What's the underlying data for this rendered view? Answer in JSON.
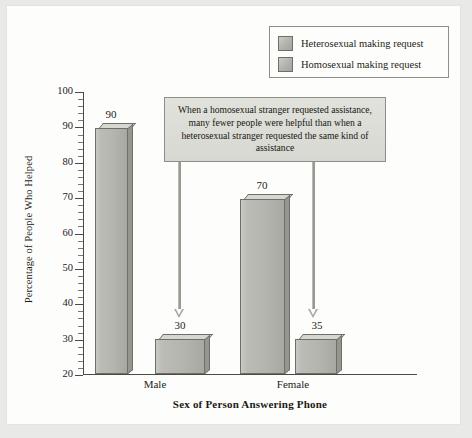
{
  "chart_data": {
    "type": "bar",
    "title": "",
    "xlabel": "Sex of Person Answering Phone",
    "ylabel": "Percentage of People Who Helped",
    "categories": [
      "Male",
      "Female"
    ],
    "series": [
      {
        "name": "Heterosexual making request",
        "values": [
          90,
          70
        ]
      },
      {
        "name": "Homosexual making request",
        "values": [
          30,
          35
        ]
      }
    ],
    "ylim": [
      20,
      100
    ],
    "ytick_labels": [
      "100",
      "90",
      "80",
      "70",
      "60",
      "50",
      "40",
      "30",
      "20"
    ],
    "ytick_values": [
      100,
      90,
      80,
      70,
      60,
      50,
      40,
      30,
      20
    ],
    "minor_tick_step": 2,
    "grid": false,
    "legend_position": "top-right",
    "annotation": "When a homosexual stranger requested assistance, many fewer people were helpful than when a heterosexual stranger requested the same kind of assistance",
    "bar_value_labels": [
      "90",
      "30",
      "70",
      "35"
    ],
    "colors": {
      "bar_face": "#b4b4ae",
      "bar_top": "#d7d7d2",
      "bar_side": "#96968f",
      "bar_outline": "#6f6f69",
      "axis": "#4a4a46",
      "background": "#fdfdfb",
      "page_background": "#e9e9e7",
      "annotation_fill": "#dcdcd7",
      "arrow": "#9a9a93"
    }
  },
  "legend": {
    "items": [
      {
        "label": "Heterosexual making request"
      },
      {
        "label": "Homosexual making request"
      }
    ]
  },
  "axes": {
    "y_title": "Percentage of People Who Helped",
    "x_title": "Sex of Person Answering Phone",
    "y_ticks": [
      "100",
      "90",
      "80",
      "70",
      "60",
      "50",
      "40",
      "30",
      "20"
    ],
    "x_categories": [
      "Male",
      "Female"
    ]
  },
  "bars": [
    {
      "value_label": "90",
      "group": "Male",
      "series": "Heterosexual making request"
    },
    {
      "value_label": "30",
      "group": "Male",
      "series": "Homosexual making request"
    },
    {
      "value_label": "70",
      "group": "Female",
      "series": "Heterosexual making request"
    },
    {
      "value_label": "35",
      "group": "Female",
      "series": "Homosexual making request"
    }
  ],
  "annotation": {
    "text": "When a homosexual stranger requested assistance, many fewer people were helpful than when a heterosexual stranger requested the same kind of assistance"
  }
}
